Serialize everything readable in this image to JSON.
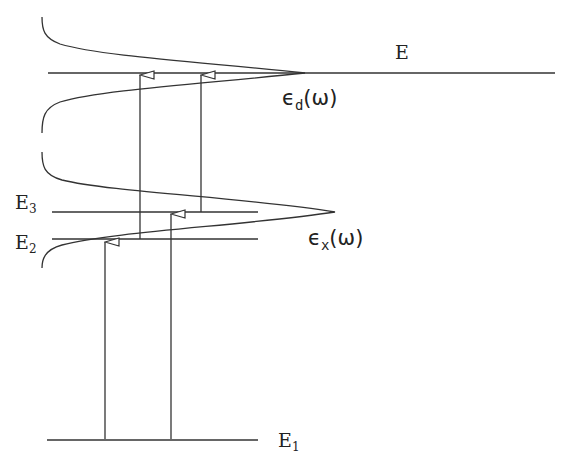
{
  "diagram": {
    "type": "energy-level diagram",
    "levels": [
      {
        "id": "E",
        "label": "E",
        "y": 73
      },
      {
        "id": "E3",
        "label_main": "E",
        "label_sub": "3",
        "y": 212
      },
      {
        "id": "E2",
        "label_main": "E",
        "label_sub": "2",
        "y": 239
      },
      {
        "id": "E1",
        "label_main": "E",
        "label_sub": "1",
        "y": 440
      }
    ],
    "curves": [
      {
        "id": "eps_d",
        "label_main": "ϵ",
        "label_sub": "d",
        "label_arg": "(ω)"
      },
      {
        "id": "eps_x",
        "label_main": "ϵ",
        "label_sub": "x",
        "label_arg": "(ω)"
      }
    ],
    "transitions": [
      {
        "from": "E1",
        "to": "E2"
      },
      {
        "from": "E1",
        "to": "E3"
      },
      {
        "from": "E2",
        "to": "E"
      },
      {
        "from": "E3",
        "to": "E"
      }
    ],
    "line_color": "#333333"
  }
}
